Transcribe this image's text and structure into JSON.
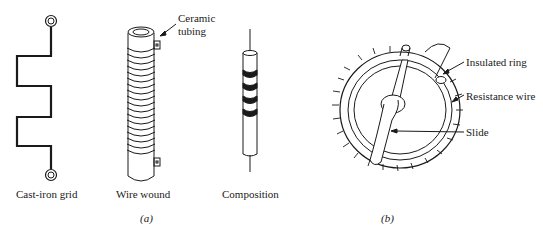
{
  "panel_a": {
    "caption": "(a)",
    "items": [
      {
        "name": "cast-iron-grid",
        "label": "Cast-iron grid"
      },
      {
        "name": "wire-wound",
        "label": "Wire wound",
        "annotation": "Ceramic tubing"
      },
      {
        "name": "composition",
        "label": "Composition"
      }
    ],
    "ceramic_line1": "Ceramic",
    "ceramic_line2": "tubing"
  },
  "panel_b": {
    "caption": "(b)",
    "annotations": {
      "insulated_ring": "Insulated ring",
      "resistance_wire": "Resistance wire",
      "slide": "Slide"
    }
  }
}
